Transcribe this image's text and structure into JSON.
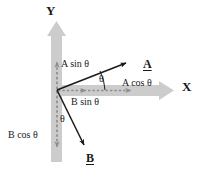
{
  "figure": {
    "colors": {
      "axis_gray": "#c9c9c9",
      "vector_black": "#1a1a1a",
      "dashed_gray": "#9a9a9a",
      "text": "#1a1a1a",
      "background": "#ffffff"
    },
    "axes": {
      "y_label": "Y",
      "x_label": "X",
      "origin": {
        "x": 57,
        "y": 90
      }
    },
    "vectors": [
      {
        "name": "A",
        "label": "A",
        "from": {
          "x": 57,
          "y": 90
        },
        "to": {
          "x": 128,
          "y": 62
        },
        "angle_label": "θ",
        "components": {
          "horizontal_label": "A cos θ",
          "vertical_label": "A sin θ"
        }
      },
      {
        "name": "B",
        "label": "B",
        "from": {
          "x": 57,
          "y": 90
        },
        "to": {
          "x": 85,
          "y": 148
        },
        "angle_label": "θ",
        "components": {
          "horizontal_label": "B sin θ",
          "vertical_label": "B cos θ"
        }
      }
    ],
    "labels": {
      "y_axis": "Y",
      "x_axis": "X",
      "a_sin_theta": "A sin θ",
      "a_cos_theta": "A cos θ",
      "b_sin_theta": "B sin θ",
      "b_cos_theta": "B cos θ",
      "vector_a": "A",
      "vector_b": "B",
      "theta_a": "θ",
      "theta_b": "θ"
    }
  }
}
